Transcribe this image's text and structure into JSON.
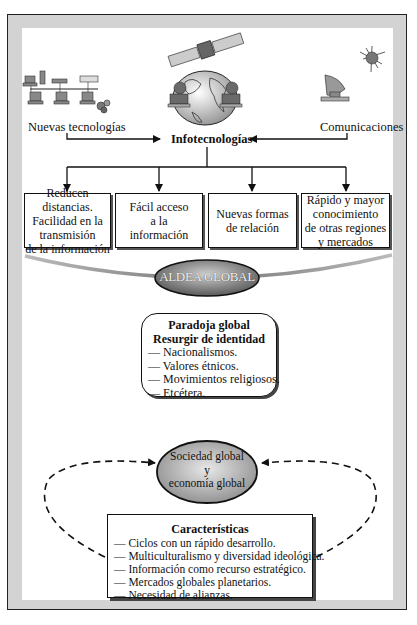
{
  "top": {
    "left_label": "Nuevas tecnologías",
    "right_label": "Comunicaciones",
    "center_label": "Infotecnologías",
    "icons": [
      "computer-network-icon",
      "satellite-globe-icon",
      "satellite-dish-icon"
    ]
  },
  "effects": [
    {
      "lines": [
        "Reducen distancias.",
        "Facilidad en la",
        "transmisión",
        "de la información"
      ]
    },
    {
      "lines": [
        "Fácil acceso",
        "a la",
        "información"
      ]
    },
    {
      "lines": [
        "Nuevas formas",
        "de relación"
      ]
    },
    {
      "lines": [
        "Rápido y mayor",
        "conocimiento",
        "de otras regiones",
        "y mercados"
      ]
    }
  ],
  "aldea": {
    "label": "ALDEA GLOBAL"
  },
  "paradoja": {
    "title1": "Paradoja global",
    "title2": "Resurgir de identidad",
    "items": [
      "— Nacionalismos.",
      "— Valores étnicos.",
      "— Movimientos religiosos.",
      "— Etcétera."
    ]
  },
  "sociedad": {
    "lines": [
      "Sociedad global",
      "y",
      "economía global"
    ]
  },
  "caracteristicas": {
    "title": "Características",
    "items": [
      "— Ciclos con un rápido desarrollo.",
      "— Multiculturalismo y diversidad ideológica.",
      "— Información como recurso estratégico.",
      "— Mercados globales planetarios.",
      "— Necesidad de alianzas."
    ]
  },
  "colors": {
    "frame": "#d3d3d3",
    "ellipse": "#9a9a9a",
    "line": "#111111"
  }
}
